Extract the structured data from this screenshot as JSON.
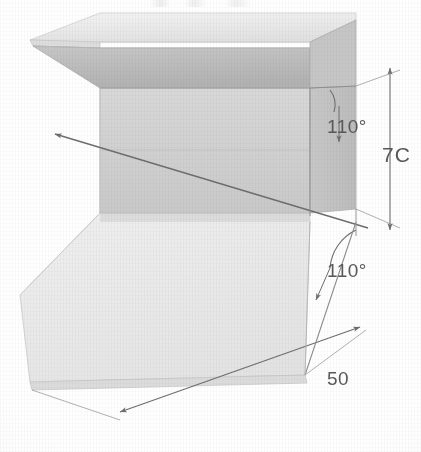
{
  "drawing": {
    "title": "Isometric sheet-metal bracket",
    "description": "Isometric pictorial view of a folded sheet-metal channel bracket with an upper flange, a vertical web and a lower base flange",
    "background_color": "#ffffff",
    "line_color": "#6e6e70",
    "text_color": "#59595b",
    "face_colors": {
      "top_flange_top": "#e9e9e9",
      "top_flange_under": "#bdbdbd",
      "top_flange_edge": "#d4d4d4",
      "web_front": "#d2d2d2",
      "web_side": "#c3c3c3",
      "base_top": "#ececec",
      "base_edge": "#dcdcdc"
    },
    "dimensions": [
      {
        "id": "height",
        "name": "overall-height-dimension",
        "value": "70",
        "display_text": "7C",
        "note": "right-edge vertical dimension, glyph clipped by page crop",
        "orientation": "vertical",
        "position": "right"
      },
      {
        "id": "flange-width",
        "name": "base-flange-width-dimension",
        "value": "50",
        "display_text": "50",
        "orientation": "diagonal",
        "position": "bottom-right"
      }
    ],
    "angles": [
      {
        "id": "upper-bend",
        "name": "upper-bend-angle",
        "value": "110",
        "display_text": "110°",
        "position": "upper-right"
      },
      {
        "id": "lower-bend",
        "name": "lower-bend-angle",
        "value": "110",
        "display_text": "110°",
        "position": "lower-right"
      }
    ],
    "leader": {
      "name": "unlabelled-leader-line",
      "direction": "points-left",
      "has_arrowhead": true,
      "label": ""
    }
  }
}
